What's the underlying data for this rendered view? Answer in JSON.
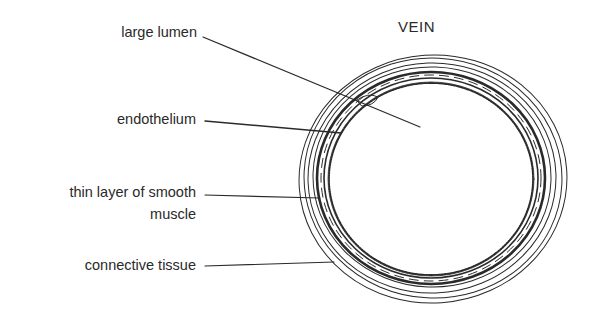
{
  "diagram": {
    "title": "VEIN",
    "labels": [
      {
        "id": "large-lumen",
        "text": "large lumen"
      },
      {
        "id": "endothelium",
        "text": "endothelium"
      },
      {
        "id": "smooth-muscle",
        "line1": "thin layer of smooth",
        "line2": "muscle"
      },
      {
        "id": "connective-tissue",
        "text": "connective tissue"
      }
    ],
    "colors": {
      "ink": "#2a2a2a",
      "background": "#ffffff"
    }
  }
}
